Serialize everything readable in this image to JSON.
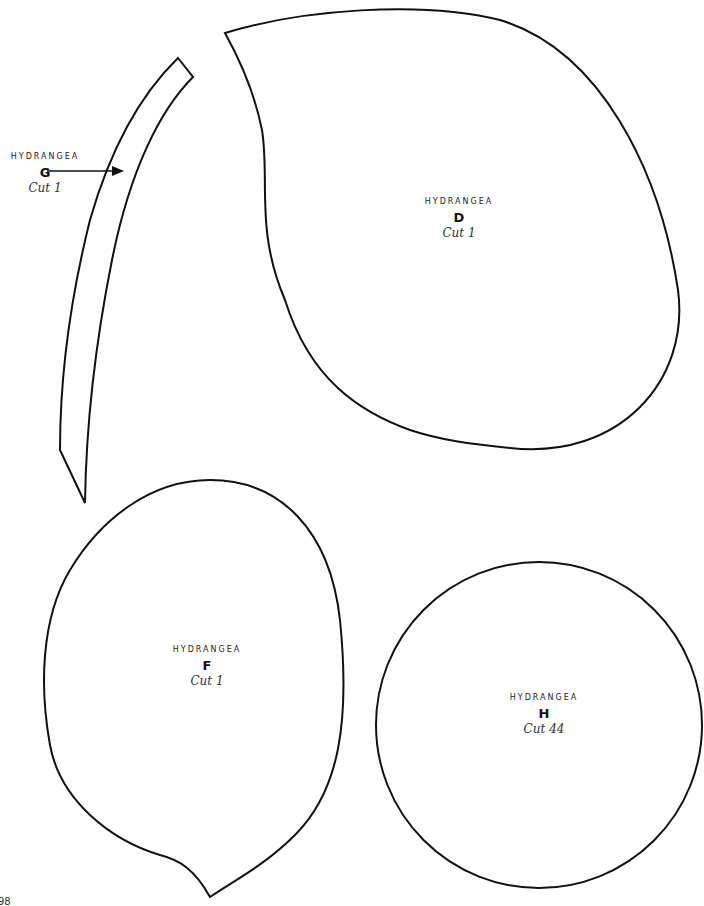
{
  "page": {
    "background": "#ffffff",
    "stroke_color": "#111111",
    "page_number_partial": "98"
  },
  "pieces": [
    {
      "id": "G",
      "name": "HYDRANGEA",
      "letter": "G",
      "cut": "Cut 1",
      "shape": "long curved strip with arrow pointer"
    },
    {
      "id": "D",
      "name": "HYDRANGEA",
      "letter": "D",
      "cut": "Cut 1",
      "shape": "large teardrop leaf"
    },
    {
      "id": "F",
      "name": "HYDRANGEA",
      "letter": "F",
      "cut": "Cut 1",
      "shape": "rounded leaf with pointed tip"
    },
    {
      "id": "H",
      "name": "HYDRANGEA",
      "letter": "H",
      "cut": "Cut 44",
      "shape": "circle"
    }
  ]
}
